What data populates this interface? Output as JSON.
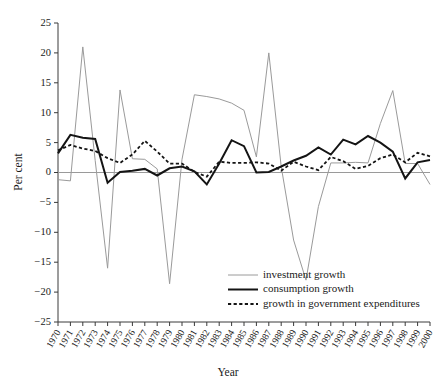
{
  "chart_data": {
    "type": "line",
    "title": "",
    "xlabel": "Year",
    "ylabel": "Per cent",
    "xlim": [
      1970,
      2000
    ],
    "ylim": [
      -25,
      25
    ],
    "yticks": [
      25,
      20,
      15,
      10,
      5,
      0,
      -5,
      -10,
      -15,
      -20,
      -25
    ],
    "ytick_labels": [
      "25",
      "20",
      "15",
      "10",
      "5",
      "0",
      "−5",
      "−10",
      "−15",
      "−20",
      "−25"
    ],
    "grid": false,
    "zero_line": true,
    "legend_position": "lower-right-inside",
    "categories": [
      1970,
      1971,
      1972,
      1973,
      1974,
      1975,
      1976,
      1977,
      1978,
      1979,
      1980,
      1981,
      1982,
      1983,
      1984,
      1985,
      1986,
      1987,
      1988,
      1989,
      1990,
      1991,
      1992,
      1993,
      1994,
      1995,
      1996,
      1997,
      1998,
      1999,
      2000
    ],
    "xtick_labels": [
      "1970",
      "1971",
      "1972",
      "1973",
      "1974",
      "1975",
      "1976",
      "1977",
      "1978",
      "1979",
      "1980",
      "1981",
      "1982",
      "1983",
      "1984",
      "1985",
      "1986",
      "1987",
      "1988",
      "1989",
      "1990",
      "1991",
      "1992",
      "1993",
      "1994",
      "1995",
      "1996",
      "1997",
      "1998",
      "1999",
      "2000"
    ],
    "series": [
      {
        "name": "investment growth",
        "key": "investment",
        "style": "solid",
        "color": "#9a9a9a",
        "width": 1,
        "values": [
          -1.2,
          -1.4,
          21.0,
          2.0,
          -16.0,
          13.8,
          2.3,
          2.2,
          0.6,
          -18.6,
          2.2,
          13.0,
          12.7,
          12.3,
          11.6,
          10.4,
          2.6,
          20.0,
          1.0,
          -11.3,
          -18.0,
          -5.7,
          1.6,
          1.6,
          1.7,
          1.6,
          8.2,
          13.7,
          1.5,
          1.5,
          -2.0
        ]
      },
      {
        "name": "consumption growth",
        "key": "consumption",
        "style": "solid",
        "color": "#141414",
        "width": 2,
        "values": [
          3.2,
          6.3,
          5.8,
          5.6,
          -1.7,
          0.1,
          0.3,
          0.6,
          -0.5,
          0.7,
          1.0,
          0.2,
          -2.0,
          1.5,
          5.4,
          4.4,
          0.0,
          0.1,
          1.0,
          2.0,
          2.8,
          4.2,
          3.0,
          5.5,
          4.7,
          6.1,
          5.0,
          3.5,
          -1.0,
          1.7,
          2.1
        ]
      },
      {
        "name": "growth in government expenditures",
        "key": "government",
        "style": "dashed",
        "color": "#141414",
        "width": 1.8,
        "values": [
          3.7,
          4.6,
          4.0,
          3.6,
          2.4,
          1.6,
          3.0,
          5.3,
          3.5,
          1.5,
          1.5,
          0.1,
          -0.7,
          1.8,
          1.6,
          1.6,
          1.7,
          1.5,
          0.3,
          1.8,
          1.0,
          0.4,
          2.6,
          1.9,
          0.6,
          1.1,
          2.4,
          3.0,
          1.7,
          3.3,
          2.7
        ]
      }
    ]
  },
  "legend": {
    "items": [
      {
        "label": "investment growth",
        "key": "investment"
      },
      {
        "label": "consumption growth",
        "key": "consumption"
      },
      {
        "label": "growth in government expenditures",
        "key": "government"
      }
    ]
  },
  "colors": {
    "investment": "#9a9a9a",
    "consumption": "#141414",
    "government": "#141414",
    "axis": "#3a3a3a",
    "zero_line": "#9a9a9a",
    "background": "#ffffff"
  }
}
